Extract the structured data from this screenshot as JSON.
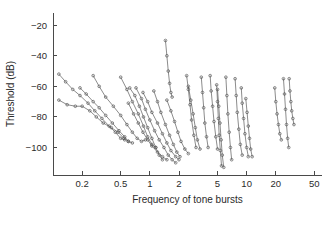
{
  "chart_data": {
    "type": "line",
    "title": "",
    "xlabel": "Frequency of tone bursts",
    "ylabel": "Threshold (dB)",
    "xscale": "log",
    "xlim": [
      0.1,
      60
    ],
    "ylim": [
      -118,
      -12
    ],
    "xticks": [
      0.2,
      0.5,
      1,
      2,
      5,
      10,
      20,
      50
    ],
    "xticklabels": [
      "0.2",
      "0.5",
      "1",
      "2",
      "5",
      "10",
      "20",
      "50"
    ],
    "yticks": [
      -20,
      -40,
      -60,
      -80,
      -100
    ],
    "yticklabels": [
      "-20",
      "-40",
      "-60",
      "-80",
      "-100"
    ],
    "grid": false,
    "legend": null,
    "marker": "open-circle",
    "line_color": "#5a5a5a",
    "series": [
      {
        "name": "fiber-01",
        "x": [
          0.115,
          0.135,
          0.16,
          0.19,
          0.23,
          0.27,
          0.32,
          0.38,
          0.44,
          0.5,
          0.55
        ],
        "y": [
          -52,
          -57,
          -62,
          -66,
          -71,
          -76,
          -81,
          -86,
          -90,
          -94,
          -95
        ]
      },
      {
        "name": "fiber-02",
        "x": [
          0.115,
          0.14,
          0.17,
          0.2,
          0.24,
          0.28,
          0.33,
          0.4,
          0.47,
          0.54,
          0.6
        ],
        "y": [
          -69,
          -72,
          -73,
          -73,
          -76,
          -80,
          -84,
          -87,
          -90,
          -94,
          -96
        ]
      },
      {
        "name": "fiber-03",
        "x": [
          0.19,
          0.22,
          0.26,
          0.3,
          0.35,
          0.41,
          0.48,
          0.55,
          0.6,
          0.66
        ],
        "y": [
          -61,
          -65,
          -70,
          -74,
          -79,
          -84,
          -89,
          -93,
          -96,
          -97
        ]
      },
      {
        "name": "fiber-04",
        "x": [
          0.26,
          0.3,
          0.35,
          0.42,
          0.5,
          0.58,
          0.66,
          0.74,
          0.82,
          0.9
        ],
        "y": [
          -53,
          -60,
          -67,
          -73,
          -79,
          -85,
          -90,
          -94,
          -96,
          -95
        ]
      },
      {
        "name": "fiber-05",
        "x": [
          0.5,
          0.58,
          0.66,
          0.76,
          0.86,
          0.95,
          1.05,
          1.15
        ],
        "y": [
          -54,
          -62,
          -70,
          -78,
          -86,
          -93,
          -98,
          -100
        ]
      },
      {
        "name": "fiber-06",
        "x": [
          0.62,
          0.7,
          0.78,
          0.86,
          0.95,
          1.05,
          1.15,
          1.25,
          1.35
        ],
        "y": [
          -61,
          -66,
          -73,
          -80,
          -87,
          -94,
          -100,
          -105,
          -108
        ]
      },
      {
        "name": "fiber-07",
        "x": [
          0.72,
          0.82,
          0.9,
          1.0,
          1.12,
          1.25,
          1.4,
          1.55,
          1.7,
          1.85
        ],
        "y": [
          -61,
          -68,
          -75,
          -82,
          -89,
          -95,
          -100,
          -105,
          -108,
          -110
        ]
      },
      {
        "name": "fiber-08",
        "x": [
          0.6,
          0.68,
          0.76,
          0.85,
          0.95,
          1.05,
          1.2,
          1.35,
          1.5
        ],
        "y": [
          -71,
          -78,
          -84,
          -90,
          -95,
          -99,
          -103,
          -106,
          -108
        ]
      },
      {
        "name": "fiber-09",
        "x": [
          0.85,
          0.95,
          1.05,
          1.2,
          1.35,
          1.5,
          1.65,
          1.85,
          2.0
        ],
        "y": [
          -64,
          -70,
          -77,
          -84,
          -91,
          -97,
          -102,
          -106,
          -108
        ]
      },
      {
        "name": "fiber-10",
        "x": [
          1.45,
          1.5,
          1.55,
          1.6,
          1.65,
          1.7
        ],
        "y": [
          -30,
          -40,
          -50,
          -58,
          -64,
          -67
        ]
      },
      {
        "name": "fiber-11",
        "x": [
          1.1,
          1.2,
          1.3,
          1.45,
          1.6,
          1.75,
          1.9,
          2.05
        ],
        "y": [
          -63,
          -70,
          -77,
          -85,
          -92,
          -98,
          -103,
          -106
        ]
      },
      {
        "name": "fiber-12",
        "x": [
          1.5,
          1.65,
          1.8,
          1.95,
          2.1,
          2.3,
          2.5
        ],
        "y": [
          -69,
          -76,
          -83,
          -90,
          -96,
          -101,
          -104
        ]
      },
      {
        "name": "fiber-13",
        "x": [
          2.4,
          2.5,
          2.6,
          2.7,
          2.85,
          3.0
        ],
        "y": [
          -53,
          -62,
          -72,
          -82,
          -92,
          -100
        ]
      },
      {
        "name": "fiber-14",
        "x": [
          2.5,
          2.65,
          2.8,
          2.95,
          3.1,
          3.3
        ],
        "y": [
          -60,
          -69,
          -78,
          -87,
          -95,
          -101
        ]
      },
      {
        "name": "fiber-15",
        "x": [
          3.4,
          3.5,
          3.6,
          3.7,
          3.85,
          4.0
        ],
        "y": [
          -54,
          -64,
          -74,
          -84,
          -93,
          -100
        ]
      },
      {
        "name": "fiber-16",
        "x": [
          4.2,
          4.3,
          4.45,
          4.6,
          4.8,
          5.0
        ],
        "y": [
          -53,
          -63,
          -73,
          -83,
          -93,
          -101
        ]
      },
      {
        "name": "fiber-17",
        "x": [
          4.9,
          5.0,
          5.1,
          5.2,
          5.35,
          5.5
        ],
        "y": [
          -59,
          -70,
          -81,
          -92,
          -102,
          -112
        ]
      },
      {
        "name": "fiber-18",
        "x": [
          5.0,
          5.15,
          5.3,
          5.45,
          5.6,
          5.8
        ],
        "y": [
          -62,
          -73,
          -84,
          -95,
          -105,
          -113
        ]
      },
      {
        "name": "fiber-19",
        "x": [
          6.1,
          6.25,
          6.4,
          6.6,
          6.8,
          7.0
        ],
        "y": [
          -54,
          -66,
          -78,
          -90,
          -100,
          -108
        ]
      },
      {
        "name": "fiber-20",
        "x": [
          7.6,
          7.8,
          8.0,
          8.3,
          8.6,
          9.0
        ],
        "y": [
          -55,
          -66,
          -77,
          -88,
          -98,
          -105
        ]
      },
      {
        "name": "fiber-21",
        "x": [
          8.8,
          9.0,
          9.3,
          9.6,
          10.0,
          10.4
        ],
        "y": [
          -61,
          -71,
          -81,
          -91,
          -100,
          -106
        ]
      },
      {
        "name": "fiber-22",
        "x": [
          9.8,
          10.1,
          10.4,
          10.7,
          11.0,
          11.4
        ],
        "y": [
          -68,
          -77,
          -86,
          -94,
          -101,
          -106
        ]
      },
      {
        "name": "fiber-23",
        "x": [
          19.5,
          20.0,
          20.6,
          21.3,
          22.0,
          22.8
        ],
        "y": [
          -61,
          -70,
          -78,
          -85,
          -91,
          -95
        ]
      },
      {
        "name": "fiber-24",
        "x": [
          24.0,
          24.6,
          25.2,
          25.8,
          26.5,
          27.2
        ],
        "y": [
          -55,
          -65,
          -75,
          -85,
          -94,
          -100
        ]
      },
      {
        "name": "fiber-25",
        "x": [
          27.5,
          28.0,
          28.6,
          29.2,
          30.0,
          30.8
        ],
        "y": [
          -55,
          -63,
          -70,
          -76,
          -81,
          -85
        ]
      }
    ]
  },
  "figure": {
    "background_color": "#ffffff",
    "axis_color": "#4a4a4a"
  }
}
